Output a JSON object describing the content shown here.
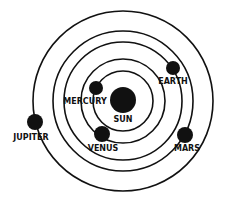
{
  "diagram": {
    "center": {
      "x": 123,
      "y": 101
    },
    "colors": {
      "ink": "#111111",
      "background": "#ffffff"
    },
    "sun": {
      "label": "SUN",
      "radius": 13
    },
    "orbits": [
      30,
      42,
      59,
      70,
      90
    ],
    "planets": [
      {
        "name": "MERCURY",
        "x": 96,
        "y": 88,
        "r": 7
      },
      {
        "name": "VENUS",
        "x": 102,
        "y": 134,
        "r": 8
      },
      {
        "name": "EARTH",
        "x": 173,
        "y": 68,
        "r": 7
      },
      {
        "name": "MARS",
        "x": 185,
        "y": 135,
        "r": 8
      },
      {
        "name": "JUPITER",
        "x": 35,
        "y": 122,
        "r": 8
      }
    ]
  }
}
